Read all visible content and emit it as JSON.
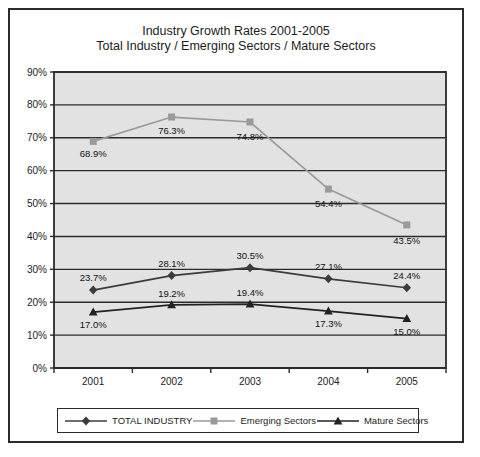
{
  "chart_data": {
    "type": "line",
    "title": "Industry Growth Rates 2001-2005",
    "subtitle": "Total Industry / Emerging Sectors / Mature Sectors",
    "xlabel": "",
    "ylabel": "",
    "categories": [
      "2001",
      "2002",
      "2003",
      "2004",
      "2005"
    ],
    "ylim": [
      0,
      90
    ],
    "ytick_labels": [
      "0%",
      "10%",
      "20%",
      "30%",
      "40%",
      "50%",
      "60%",
      "70%",
      "80%",
      "90%"
    ],
    "ytick_values": [
      0,
      10,
      20,
      30,
      40,
      50,
      60,
      70,
      80,
      90
    ],
    "grid": true,
    "legend_position": "bottom",
    "plot_background": "#e2e2e2",
    "series": [
      {
        "name": "TOTAL INDUSTRY",
        "marker": "diamond",
        "color": "#3b3b3b",
        "values": [
          23.7,
          28.1,
          30.5,
          27.1,
          24.4
        ],
        "labels": [
          "23.7%",
          "28.1%",
          "30.5%",
          "27.1%",
          "24.4%"
        ]
      },
      {
        "name": "Emerging Sectors",
        "marker": "square",
        "color": "#9a9a9a",
        "values": [
          68.9,
          76.3,
          74.8,
          54.4,
          43.5
        ],
        "labels": [
          "68.9%",
          "76.3%",
          "74.8%",
          "54.4%",
          "43.5%"
        ]
      },
      {
        "name": "Mature Sectors",
        "marker": "triangle",
        "color": "#222222",
        "values": [
          17.0,
          19.2,
          19.4,
          17.3,
          15.0
        ],
        "labels": [
          "17.0%",
          "19.2%",
          "19.4%",
          "17.3%",
          "15.0%"
        ]
      }
    ]
  },
  "legend": {
    "items": [
      {
        "label": "TOTAL INDUSTRY",
        "marker": "diamond",
        "color": "#3b3b3b"
      },
      {
        "label": "Emerging Sectors",
        "marker": "square",
        "color": "#9a9a9a"
      },
      {
        "label": "Mature Sectors",
        "marker": "triangle",
        "color": "#222222"
      }
    ]
  }
}
